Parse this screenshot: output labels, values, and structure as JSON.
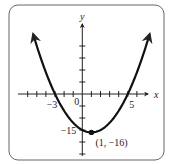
{
  "chart_data": {
    "type": "line",
    "title": "",
    "function": "y = (x - 1)^2 - 16",
    "xlabel": "x",
    "ylabel": "y",
    "xlim": [
      -6,
      7
    ],
    "ylim": [
      -20,
      25
    ],
    "grid": false,
    "x_tick_step": 1,
    "y_tick_step": 5,
    "x_tick_labels": [
      {
        "value": -3,
        "label": "−3"
      },
      {
        "value": 0,
        "label": "0"
      },
      {
        "value": 5,
        "label": "5"
      }
    ],
    "y_tick_labels": [
      {
        "value": -15,
        "label": "−15"
      }
    ],
    "x_intercepts": [
      -3,
      5
    ],
    "vertex": {
      "x": 1,
      "y": -16,
      "label": "(1, −16)"
    },
    "curve_x_range": [
      -5.4,
      7.4
    ],
    "arrows_on_curve_ends": true,
    "curve_color": "#111111",
    "axis_color": "#222222",
    "frame_color": "#555555"
  }
}
